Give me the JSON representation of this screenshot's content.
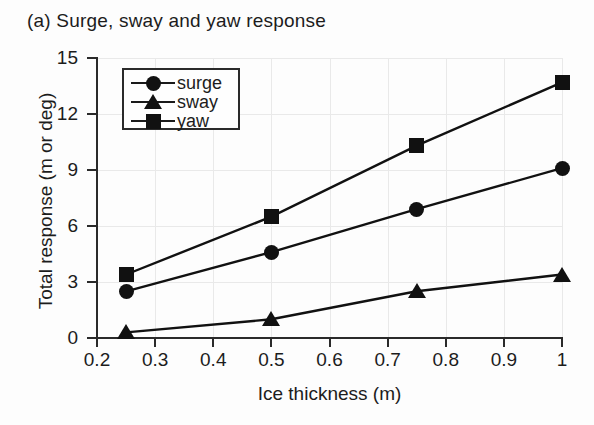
{
  "panel": {
    "title": "(a) Surge, sway and yaw response"
  },
  "chart_data": {
    "type": "line",
    "title": "(a) Surge, sway and yaw response",
    "xlabel": "Ice thickness (m)",
    "ylabel": "Total response (m or deg)",
    "x": [
      0.25,
      0.5,
      0.75,
      1.0
    ],
    "xlim": [
      0.2,
      1.0
    ],
    "ylim": [
      0,
      15
    ],
    "xticks": [
      0.2,
      0.3,
      0.4,
      0.5,
      0.6,
      0.7,
      0.8,
      0.9,
      1.0
    ],
    "xtick_labels": [
      "0.2",
      "0.3",
      "0.4",
      "0.5",
      "0.6",
      "0.7",
      "0.8",
      "0.9",
      "1"
    ],
    "yticks": [
      0,
      3,
      6,
      9,
      12,
      15
    ],
    "ytick_labels": [
      "0",
      "3",
      "6",
      "9",
      "12",
      "15"
    ],
    "grid": true,
    "legend_position": "upper-left",
    "series": [
      {
        "name": "surge",
        "marker": "circle",
        "color": "#111111",
        "values": [
          2.5,
          4.6,
          6.9,
          9.1
        ]
      },
      {
        "name": "sway",
        "marker": "triangle",
        "color": "#111111",
        "values": [
          0.3,
          1.0,
          2.5,
          3.4
        ]
      },
      {
        "name": "yaw",
        "marker": "square",
        "color": "#111111",
        "values": [
          3.4,
          6.5,
          10.3,
          13.7
        ]
      }
    ]
  },
  "legend": {
    "items": [
      {
        "label": "surge",
        "marker": "circle"
      },
      {
        "label": "sway",
        "marker": "triangle"
      },
      {
        "label": "yaw",
        "marker": "square"
      }
    ]
  }
}
